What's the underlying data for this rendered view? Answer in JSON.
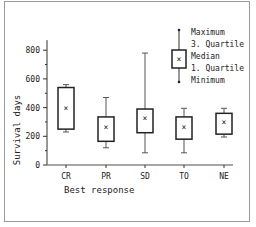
{
  "chart_data": {
    "type": "box",
    "title": "",
    "xlabel": "Best response",
    "ylabel": "Survival days",
    "ylim": [
      0,
      900
    ],
    "yticks": [
      0,
      200,
      400,
      600,
      800
    ],
    "categories": [
      "CR",
      "PR",
      "SD",
      "TO",
      "NE"
    ],
    "series": [
      {
        "name": "CR",
        "max": 560,
        "q3": 540,
        "median": 400,
        "q1": 250,
        "min": 230
      },
      {
        "name": "PR",
        "max": 470,
        "q3": 335,
        "median": 265,
        "q1": 165,
        "min": 120
      },
      {
        "name": "SD",
        "max": 780,
        "q3": 390,
        "median": 325,
        "q1": 225,
        "min": 85
      },
      {
        "name": "TO",
        "max": 395,
        "q3": 335,
        "median": 265,
        "q1": 180,
        "min": 85
      },
      {
        "name": "NE",
        "max": 395,
        "q3": 360,
        "median": 300,
        "q1": 215,
        "min": 195
      }
    ],
    "legend": {
      "position": "top-right",
      "items": [
        "Maximum",
        "3. Quartile",
        "Median",
        "1. Quartile",
        "Minimum"
      ]
    },
    "grid": false
  }
}
